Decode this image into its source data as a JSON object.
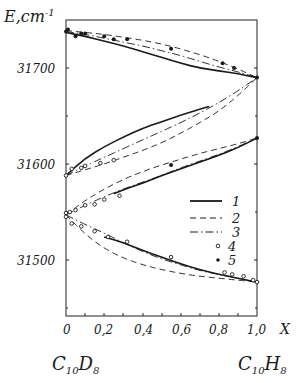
{
  "chart_data": {
    "type": "line",
    "title": "",
    "xlabel": "X",
    "ylabel": "E, cm⁻¹",
    "xlim": [
      0,
      1.0
    ],
    "ylim": [
      31450,
      31750
    ],
    "x_ticks": [
      "0",
      "0,2",
      "0,4",
      "0,6",
      "0,8",
      "1,0"
    ],
    "y_ticks": [
      "31500",
      "31600",
      "31700"
    ],
    "x_endpoint_labels": {
      "left": "C10D8",
      "right": "C10H8"
    },
    "grid": false,
    "legend_position": "inside-right-middle",
    "legend": [
      {
        "key": "1",
        "style": "solid"
      },
      {
        "key": "2",
        "style": "dashed"
      },
      {
        "key": "3",
        "style": "dash-dot"
      },
      {
        "key": "4",
        "style": "open-circle"
      },
      {
        "key": "5",
        "style": "filled-circle"
      }
    ],
    "branches": [
      {
        "name": "upper",
        "curves": {
          "1": {
            "x": [
              0,
              0.1,
              0.2,
              0.3,
              0.4,
              0.5,
              0.6,
              0.7,
              0.8,
              0.9,
              1.0
            ],
            "y": [
              31737,
              31733,
              31728,
              31723,
              31717,
              31711,
              31705,
              31700,
              31697,
              31694,
              31690
            ]
          },
          "2": {
            "x": [
              0,
              0.1,
              0.2,
              0.3,
              0.4,
              0.5,
              0.6,
              0.7,
              0.8,
              0.9,
              1.0
            ],
            "y": [
              31739,
              31737,
              31735,
              31732,
              31729,
              31725,
              31720,
              31714,
              31707,
              31699,
              31690
            ]
          },
          "3": {
            "x": [
              0,
              0.1,
              0.2,
              0.3,
              0.4,
              0.5,
              0.6,
              0.7,
              0.8,
              0.9,
              1.0
            ],
            "y": [
              31738,
              31735,
              31731,
              31727,
              31723,
              31718,
              31713,
              31707,
              31701,
              31696,
              31690
            ]
          }
        },
        "points_5": {
          "x": [
            0.0,
            0.01,
            0.05,
            0.08,
            0.1,
            0.2,
            0.25,
            0.32,
            0.55,
            0.82,
            0.88,
            1.0
          ],
          "y": [
            31738,
            31740,
            31733,
            31736,
            31736,
            31733,
            31730,
            31730,
            31720,
            31705,
            31700,
            31690
          ]
        }
      },
      {
        "name": "middle-upper",
        "curves": {
          "1": {
            "x": [
              0,
              0.1,
              0.2,
              0.3,
              0.4,
              0.5,
              0.6,
              0.7,
              0.75
            ],
            "y": [
              31588,
              31606,
              31618,
              31628,
              31637,
              31644,
              31651,
              31657,
              31660
            ]
          },
          "2": {
            "x": [
              0,
              0.1,
              0.2,
              0.3,
              0.4,
              0.5,
              0.6,
              0.7,
              0.8,
              0.9,
              1.0
            ],
            "y": [
              31588,
              31594,
              31600,
              31607,
              31614,
              31622,
              31632,
              31643,
              31655,
              31671,
              31690
            ]
          },
          "3": {
            "x": [
              0,
              0.1,
              0.2,
              0.3,
              0.4,
              0.5,
              0.6,
              0.7,
              0.8,
              0.9,
              1.0
            ],
            "y": [
              31588,
              31598,
              31607,
              31616,
              31625,
              31634,
              31643,
              31653,
              31664,
              31676,
              31690
            ]
          }
        },
        "points_4": {
          "x": [
            0.0,
            0.03,
            0.08,
            0.1,
            0.18,
            0.25
          ],
          "y": [
            31588,
            31595,
            31596,
            31598,
            31601,
            31604
          ]
        }
      },
      {
        "name": "middle-lower",
        "curves": {
          "1": {
            "x": [
              0.25,
              0.3,
              0.4,
              0.5,
              0.6,
              0.7,
              0.8,
              0.9,
              1.0
            ],
            "y": [
              31569,
              31573,
              31580,
              31588,
              31595,
              31602,
              31609,
              31617,
              31627
            ]
          },
          "2": {
            "x": [
              0,
              0.1,
              0.2,
              0.3,
              0.4,
              0.5,
              0.6,
              0.7,
              0.8,
              0.9,
              1.0
            ],
            "y": [
              31547,
              31562,
              31574,
              31584,
              31592,
              31599,
              31605,
              31611,
              31616,
              31621,
              31627
            ]
          },
          "3": {
            "x": [
              0,
              0.1,
              0.2,
              0.3,
              0.4,
              0.5,
              0.6,
              0.7,
              0.8,
              0.9,
              1.0
            ],
            "y": [
              31547,
              31557,
              31566,
              31574,
              31581,
              31588,
              31596,
              31603,
              31610,
              31618,
              31627
            ]
          }
        },
        "points_4": {
          "x": [
            0.0,
            0.02,
            0.05,
            0.1,
            0.15,
            0.2,
            0.28
          ],
          "y": [
            31549,
            31550,
            31552,
            31557,
            31558,
            31563,
            31567
          ]
        },
        "points_5": {
          "x": [
            0.55,
            1.0
          ],
          "y": [
            31599,
            31627
          ]
        }
      },
      {
        "name": "lower",
        "curves": {
          "1": {
            "x": [
              0.2,
              0.3,
              0.4,
              0.5,
              0.6,
              0.7,
              0.8,
              0.9,
              1.0
            ],
            "y": [
              31524,
              31518,
              31510,
              31503,
              31496,
              31490,
              31485,
              31481,
              31477
            ]
          },
          "2": {
            "x": [
              0,
              0.1,
              0.2,
              0.3,
              0.4,
              0.5,
              0.6,
              0.7,
              0.8,
              0.9,
              1.0
            ],
            "y": [
              31547,
              31527,
              31512,
              31502,
              31495,
              31490,
              31486,
              31483,
              31481,
              31479,
              31477
            ]
          },
          "3": {
            "x": [
              0,
              0.1,
              0.2,
              0.3,
              0.4,
              0.5,
              0.6,
              0.7,
              0.8,
              0.9,
              1.0
            ],
            "y": [
              31547,
              31537,
              31528,
              31518,
              31509,
              31501,
              31495,
              31489,
              31485,
              31481,
              31477
            ]
          }
        },
        "points_4": {
          "x": [
            0.0,
            0.03,
            0.08,
            0.15,
            0.22,
            0.32,
            0.55,
            0.83,
            0.87,
            0.93,
            0.98,
            1.0
          ],
          "y": [
            31545,
            31538,
            31535,
            31530,
            31524,
            31519,
            31503,
            31487,
            31485,
            31483,
            31479,
            31477
          ]
        }
      }
    ]
  },
  "labels": {
    "y_axis_title": "E,cm",
    "y_axis_sup": "-1",
    "x_axis_title": "X",
    "y_ticks": [
      "31700",
      "31600",
      "31500"
    ],
    "x_ticks": [
      "0",
      "0,2",
      "0,4",
      "0,6",
      "0,8",
      "1,0"
    ],
    "left_compound_main": "C",
    "left_compound_sub1": "10",
    "left_compound_d": "D",
    "left_compound_sub2": "8",
    "right_compound_main": "C",
    "right_compound_sub1": "10",
    "right_compound_h": "H",
    "right_compound_sub2": "8",
    "legend": [
      "1",
      "2",
      "3",
      "4",
      "5"
    ]
  }
}
